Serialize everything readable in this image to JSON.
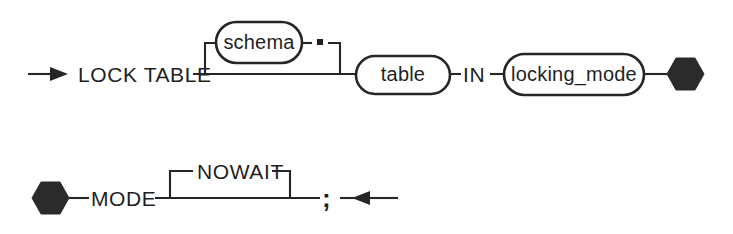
{
  "diagram": {
    "type": "railroad-syntax-diagram",
    "statement": "LOCK TABLE",
    "background_color": "#ffffff",
    "stroke_color": "#262626",
    "text_color": "#1f1f1f",
    "rows": [
      {
        "name": "row-1",
        "entry_arrow": "right-arrow",
        "terminator": "hexagon-continuation",
        "tokens": [
          {
            "kind": "keyword",
            "label": "LOCK TABLE"
          },
          {
            "kind": "nonterminal-optional",
            "label": "schema"
          },
          {
            "kind": "punctuation",
            "label": "."
          },
          {
            "kind": "nonterminal",
            "label": "table"
          },
          {
            "kind": "keyword",
            "label": "IN"
          },
          {
            "kind": "nonterminal",
            "label": "locking_mode"
          }
        ]
      },
      {
        "name": "row-2",
        "entry_marker": "hexagon-continuation",
        "exit_arrow": "left-arrow",
        "tokens": [
          {
            "kind": "keyword",
            "label": "MODE"
          },
          {
            "kind": "keyword-optional",
            "label": "NOWAIT"
          },
          {
            "kind": "punctuation",
            "label": ";"
          }
        ]
      }
    ],
    "labels": {
      "lock_table": "LOCK TABLE",
      "schema": "schema",
      "period": "▪",
      "table": "table",
      "in": "IN",
      "locking_mode": "locking_mode",
      "mode": "MODE",
      "nowait": "NOWAIT",
      "semicolon": ";"
    }
  }
}
